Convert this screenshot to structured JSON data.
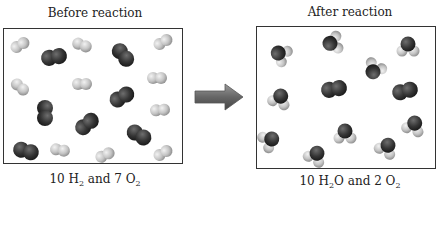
{
  "left_panel": {
    "title": "Before reaction",
    "caption": {
      "c1": "10 H",
      "s1": "2",
      "c2": " and 7 O",
      "s2": "2"
    },
    "molecules": {
      "H2_count": 10,
      "O2_count": 7
    }
  },
  "right_panel": {
    "title": "After reaction",
    "caption": {
      "c1": "10 H",
      "s1": "2",
      "c2": "O and 2 O",
      "s2": "2"
    },
    "molecules": {
      "H2O_count": 10,
      "O2_count": 2
    }
  },
  "arrow": {
    "direction": "right",
    "color": "#6a6a6a"
  },
  "colors": {
    "hydrogen": "#c8c8c8",
    "oxygen": "#3a3a3a",
    "border": "#333333"
  }
}
